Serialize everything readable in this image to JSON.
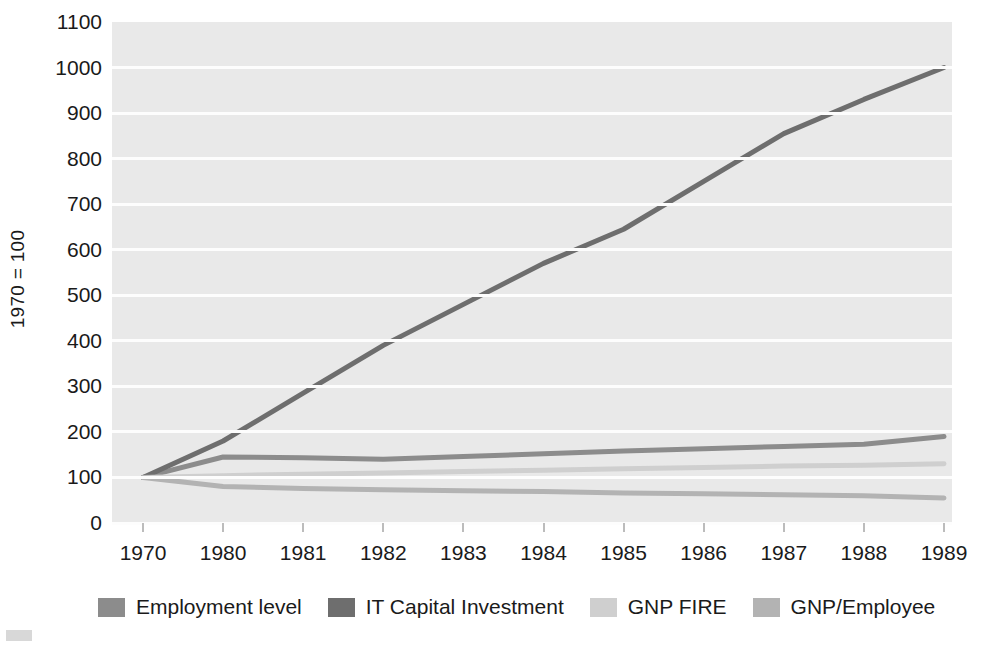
{
  "chart_data": {
    "type": "line",
    "title": "",
    "xlabel": "",
    "ylabel": "1970 = 100",
    "categories": [
      "1970",
      "1980",
      "1981",
      "1982",
      "1983",
      "1984",
      "1985",
      "1986",
      "1987",
      "1988",
      "1989"
    ],
    "ylim": [
      0,
      1100
    ],
    "ytick_values": [
      0,
      100,
      200,
      300,
      400,
      500,
      600,
      700,
      800,
      900,
      1000,
      1100
    ],
    "ytick_labels": [
      "0",
      "100",
      "200",
      "300",
      "400",
      "500",
      "600",
      "700",
      "800",
      "900",
      "1000",
      "1100"
    ],
    "grid": true,
    "legend_position": "bottom",
    "series": [
      {
        "name": "Employment level",
        "color": "#8c8c8c",
        "values": [
          100,
          145,
          143,
          140,
          146,
          152,
          158,
          163,
          168,
          173,
          190
        ]
      },
      {
        "name": "IT Capital Investment",
        "color": "#6e6e6e",
        "values": [
          100,
          180,
          285,
          390,
          480,
          570,
          645,
          750,
          855,
          930,
          1000
        ]
      },
      {
        "name": "GNP FIRE",
        "color": "#cfcfcf",
        "values": [
          100,
          104,
          107,
          110,
          113,
          116,
          119,
          122,
          125,
          127,
          130
        ]
      },
      {
        "name": "GNP/Employee",
        "color": "#b3b3b3",
        "values": [
          100,
          80,
          76,
          73,
          71,
          69,
          66,
          64,
          62,
          60,
          55
        ]
      }
    ],
    "legend": [
      {
        "label": "Employment level",
        "color": "#8c8c8c"
      },
      {
        "label": "IT Capital Investment",
        "color": "#6e6e6e"
      },
      {
        "label": "GNP FIRE",
        "color": "#cfcfcf"
      },
      {
        "label": "GNP/Employee",
        "color": "#b3b3b3"
      }
    ]
  },
  "colors": {
    "plot_background": "#e9e9e9",
    "gridline": "#fdfdfd",
    "text": "#1a1a1a",
    "page_background": "#ffffff"
  }
}
